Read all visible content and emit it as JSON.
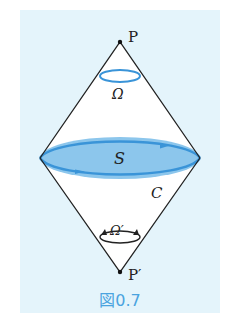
{
  "figure": {
    "caption": "図0.7",
    "colors": {
      "panel_background": "#e4f4fb",
      "accent_blue": "#3a94d8",
      "surface_fill": "#8cc6ec",
      "line": "#222222",
      "caption": "#4aa3df"
    },
    "labels": {
      "top_point": "P",
      "bottom_point": "P′",
      "top_solid_angle": "Ω",
      "bottom_solid_angle": "Ω′",
      "surface": "S",
      "curve": "C"
    }
  }
}
